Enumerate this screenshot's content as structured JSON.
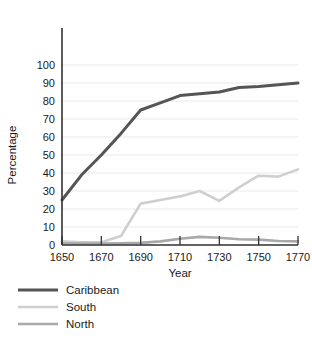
{
  "chart_data": {
    "type": "line",
    "title": "",
    "xlabel": "Year",
    "ylabel": "Percentage",
    "xlim": [
      1650,
      1770
    ],
    "ylim": [
      0,
      100
    ],
    "grid": true,
    "legend_position": "below-left",
    "x_ticks": [
      1650,
      1670,
      1690,
      1710,
      1730,
      1750,
      1770
    ],
    "x_tick_labels": [
      "1650",
      "1670",
      "1690",
      "1710",
      "1730",
      "1750",
      "1770"
    ],
    "y_ticks": [
      0,
      10,
      20,
      30,
      40,
      50,
      60,
      70,
      80,
      90,
      100
    ],
    "y_tick_labels": [
      "0",
      "10",
      "20",
      "30",
      "40",
      "50",
      "60",
      "70",
      "80",
      "90",
      "100"
    ],
    "x": [
      1650,
      1660,
      1670,
      1680,
      1690,
      1700,
      1710,
      1720,
      1730,
      1740,
      1750,
      1760,
      1770
    ],
    "series": [
      {
        "name": "Caribbean",
        "color": "#555555",
        "values": [
          25,
          39,
          50,
          62,
          75,
          79,
          83,
          84,
          85,
          87.5,
          88,
          89,
          90
        ]
      },
      {
        "name": "South",
        "color": "#cfcfcf",
        "values": [
          2,
          1.5,
          1.5,
          5,
          23,
          25,
          27,
          30,
          24.5,
          32,
          38.5,
          38,
          42
        ]
      },
      {
        "name": "North",
        "color": "#a8a8a8",
        "values": [
          1,
          0.8,
          0.8,
          1,
          1.2,
          2,
          3.5,
          4.5,
          4,
          3.2,
          3,
          2.2,
          2
        ]
      }
    ]
  },
  "legend": {
    "items": [
      {
        "label": "Caribbean",
        "color": "#555555"
      },
      {
        "label": "South",
        "color": "#cfcfcf"
      },
      {
        "label": "North",
        "color": "#a8a8a8"
      }
    ]
  },
  "axes": {
    "y_title": "Percentage",
    "x_title": "Year"
  },
  "style": {
    "grid_color": "#e3e3e3",
    "axis_color": "#333333",
    "background": "#ffffff"
  }
}
